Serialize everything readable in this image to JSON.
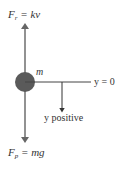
{
  "diagram": {
    "colors": {
      "line": "#555555",
      "ball": "#5a5a5a",
      "text": "#333333"
    },
    "labels": {
      "force_up": {
        "symbol": "F",
        "subscript": "r",
        "rest": " = kv"
      },
      "force_down": {
        "symbol": "F",
        "subscript": "p",
        "rest": " = mg"
      },
      "mass": "m",
      "origin": "y = 0",
      "direction": "y positive"
    },
    "elements": [
      {
        "id": "mass-ball",
        "type": "circle"
      },
      {
        "id": "force-up-arrow",
        "type": "arrow",
        "direction": "up"
      },
      {
        "id": "force-down-arrow",
        "type": "arrow",
        "direction": "down"
      },
      {
        "id": "y-zero-line",
        "type": "line",
        "direction": "horizontal"
      },
      {
        "id": "y-positive-arrow",
        "type": "arrow",
        "direction": "down"
      }
    ]
  }
}
